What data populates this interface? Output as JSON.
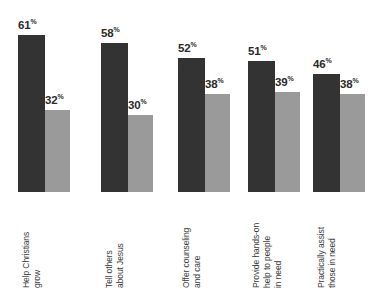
{
  "chart_data": {
    "type": "bar",
    "title": "",
    "subtitle": "",
    "xlabel": "",
    "ylabel": "",
    "ylim": [
      0,
      100
    ],
    "grid": false,
    "legend": "none",
    "orientation": "vertical",
    "grouping": "grouped",
    "value_suffix": "%",
    "categories": [
      "Help Christians grow",
      "Tell others about Jesus",
      "Offer counseling and care",
      "Provide hands-on help to people in need",
      "Practically assist those in need"
    ],
    "category_lines": [
      [
        "Help Christians",
        "grow"
      ],
      [
        "Tell others",
        "about Jesus"
      ],
      [
        "Offer counseling",
        "and care"
      ],
      [
        "Provide hands-on",
        "help to people",
        "in need"
      ],
      [
        "Practically assist",
        "those in need"
      ]
    ],
    "series": [
      {
        "name": "series-1",
        "color": "#333333",
        "values": [
          61,
          58,
          52,
          51,
          46
        ],
        "labels": [
          "61",
          "58",
          "52",
          "51",
          "46"
        ]
      },
      {
        "name": "series-2",
        "color": "#9a9a9a",
        "values": [
          32,
          30,
          38,
          39,
          38
        ],
        "labels": [
          "32",
          "30",
          "38",
          "39",
          "38"
        ]
      }
    ],
    "percent_symbol": "%"
  },
  "style": {
    "background": "#ffffff",
    "dark_bar_color": "#333333",
    "light_bar_color": "#9a9a9a",
    "label_color": "#2b2b2b",
    "category_color": "#3a3a3a"
  }
}
